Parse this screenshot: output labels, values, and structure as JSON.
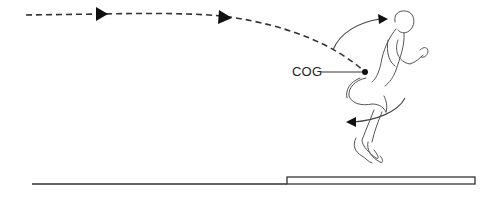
{
  "diagram": {
    "title": "",
    "labels": {
      "cog": "COG"
    },
    "elements": [
      "dashed-trajectory-path",
      "trajectory-arrow-1",
      "trajectory-arrow-2",
      "center-of-gravity-dot",
      "forward-rotation-arrow-upper",
      "backward-rotation-arrow-lower",
      "sprinter-figure",
      "ground-line",
      "takeoff-board"
    ],
    "colors": {
      "stroke": "#222222",
      "figure": "#444444",
      "background": "#ffffff"
    }
  }
}
